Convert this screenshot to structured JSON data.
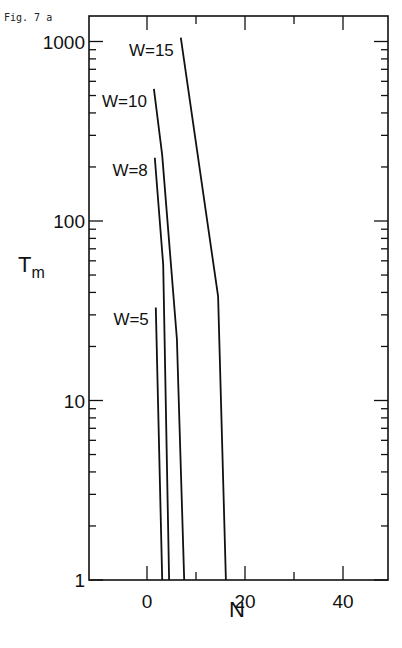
{
  "figure_label": "Fig. 7 a",
  "chart_data": {
    "type": "line",
    "title": "",
    "xlabel": "N",
    "ylabel": "T_m",
    "ylabel_main": "T",
    "ylabel_sub": "m",
    "xscale": "linear",
    "yscale": "log",
    "xlim": [
      -12,
      50
    ],
    "ylim": [
      1,
      1200
    ],
    "x_ticks": [
      0,
      20,
      40
    ],
    "x_tick_labels": [
      "0",
      "20",
      "40"
    ],
    "y_ticks": [
      1,
      10,
      100,
      1000
    ],
    "y_tick_labels": [
      "1",
      "10",
      "100",
      "1000"
    ],
    "grid": false,
    "legend": "inline labels",
    "series": [
      {
        "name": "W=15",
        "label": "W=15",
        "x": [
          6.9,
          14.5,
          16.1
        ],
        "y": [
          1050,
          38,
          1
        ]
      },
      {
        "name": "W=10",
        "label": "W=10",
        "x": [
          1.4,
          3.1,
          6.1,
          7.6
        ],
        "y": [
          545,
          233,
          22,
          1
        ]
      },
      {
        "name": "W=8",
        "label": "W=8",
        "x": [
          1.6,
          3.3,
          4.5
        ],
        "y": [
          225,
          57,
          1
        ]
      },
      {
        "name": "W=5",
        "label": "W=5",
        "x": [
          1.8,
          3.1
        ],
        "y": [
          33,
          1
        ]
      }
    ]
  }
}
